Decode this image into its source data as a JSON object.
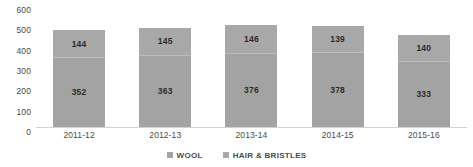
{
  "chart_data": {
    "type": "bar",
    "subtype": "stacked-vertical-bar",
    "title": "",
    "subtitle": "",
    "xlabel": "",
    "ylabel": "",
    "ylim": [
      0,
      600
    ],
    "yticks": [
      "0",
      "100",
      "200",
      "300",
      "400",
      "500",
      "600"
    ],
    "ytick_values": [
      0,
      100,
      200,
      300,
      400,
      500,
      600
    ],
    "grid": false,
    "legend_position": "bottom-center",
    "categories": [
      "2011-12",
      "2012-13",
      "2013-14",
      "2014-15",
      "2015-16"
    ],
    "series": [
      {
        "name": "WOOL",
        "color": "#a3a3a3",
        "values": [
          352,
          363,
          376,
          378,
          333
        ],
        "labels": [
          "352",
          "363",
          "376",
          "378",
          "333"
        ]
      },
      {
        "name": "HAIR & BRISTLES",
        "color": "#a8a8a8",
        "values": [
          144,
          145,
          146,
          139,
          140
        ],
        "labels": [
          "144",
          "145",
          "146",
          "139",
          "140"
        ]
      }
    ],
    "totals": [
      496,
      508,
      522,
      517,
      473
    ]
  },
  "legend": {
    "items": [
      {
        "label": "WOOL",
        "color": "#a3a3a3"
      },
      {
        "label": "HAIR & BRISTLES",
        "color": "#a8a8a8"
      }
    ]
  },
  "axis_colors": {
    "baseline": "#d2d2d2",
    "tick_text": "#4a4a4a",
    "data_label": "#2b2b2b"
  }
}
